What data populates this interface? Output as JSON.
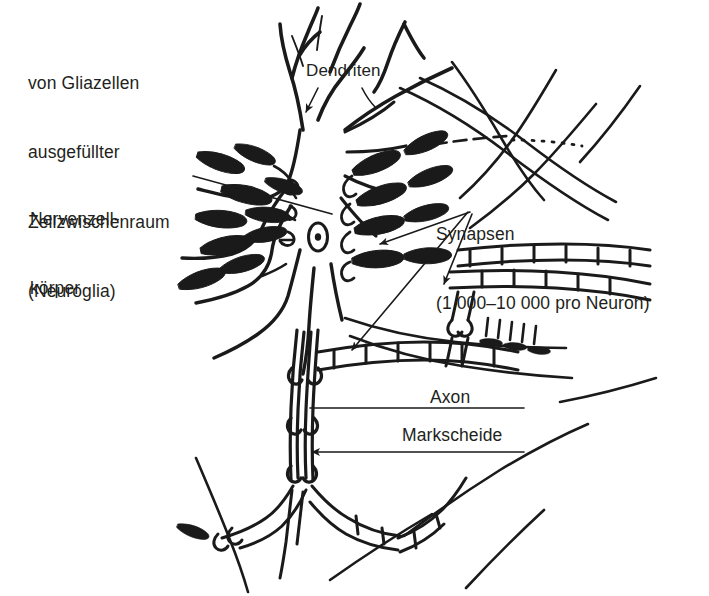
{
  "figure": {
    "background_color": "#ffffff",
    "ink_color": "#1a1a1a",
    "text_color": "#231f20",
    "width": 709,
    "height": 596
  },
  "labels": {
    "neuroglia": {
      "line1": "von Gliazellen",
      "line2": "ausgefüllter",
      "line3": "Zellzwischenraum",
      "line4": "(Neuroglia)"
    },
    "soma": {
      "line1": "Nervenzell-",
      "line2": "körper"
    },
    "dendrites": {
      "text": "Dendriten"
    },
    "synapses": {
      "line1": "Synapsen",
      "line2": "(1 000–10 000 pro Neuron)"
    },
    "axon": {
      "text": "Axon"
    },
    "myelin": {
      "text": "Markscheide"
    }
  },
  "structures": {
    "soma": "cell-body",
    "nucleus": "nucleus-with-nucleolus",
    "dendrite_count_visible": 6,
    "synaptic_boutons_visible": 14,
    "axon": "myelinated-axon",
    "myelin": "myelin-sheath-segments",
    "nodes_of_ranvier": 5
  }
}
